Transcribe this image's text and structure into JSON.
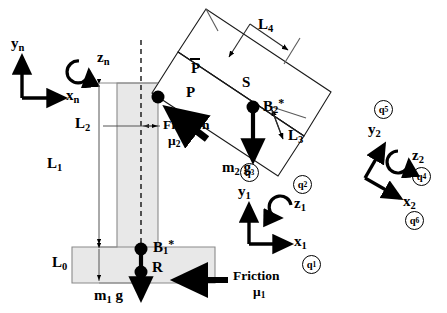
{
  "figure": {
    "type": "mechanism-free-body-diagram",
    "title": "",
    "background": "#ffffff",
    "line_color": "#000000",
    "body1_fill": "#e8e8e8",
    "body2_fill": "#ffffff"
  },
  "frames": {
    "n": {
      "x_label": "x",
      "x_sub": "n",
      "y_label": "y",
      "y_sub": "n",
      "z_label": "z",
      "z_sub": "n"
    },
    "one": {
      "x_label": "x",
      "x_sub": "1",
      "y_label": "y",
      "y_sub": "1",
      "z_label": "z",
      "z_sub": "1"
    },
    "two": {
      "x_label": "x",
      "x_sub": "2",
      "y_label": "y",
      "y_sub": "2",
      "z_label": "z",
      "z_sub": "2"
    }
  },
  "generalized_coords": {
    "q1": {
      "letter": "q",
      "index": "1"
    },
    "q2": {
      "letter": "q",
      "index": "2"
    },
    "q3": {
      "letter": "q",
      "index": "3"
    },
    "q4": {
      "letter": "q",
      "index": "4"
    },
    "q5": {
      "letter": "q",
      "index": "5"
    },
    "q6": {
      "letter": "q",
      "index": "6"
    }
  },
  "dimensions": [
    {
      "name": "L0",
      "letter": "L",
      "index": "0"
    },
    {
      "name": "L1",
      "letter": "L",
      "index": "1"
    },
    {
      "name": "L2",
      "letter": "L",
      "index": "2"
    },
    {
      "name": "L3",
      "letter": "L",
      "index": "3"
    },
    {
      "name": "L4",
      "letter": "L",
      "index": "4"
    }
  ],
  "points": [
    {
      "name": "P",
      "label": "P"
    },
    {
      "name": "P-bar",
      "label": "P",
      "overbar": true
    },
    {
      "name": "S",
      "label": "S"
    },
    {
      "name": "R",
      "label": "R"
    },
    {
      "name": "B1-star",
      "letter": "B",
      "index": "1",
      "star": "*"
    },
    {
      "name": "B2-star",
      "letter": "B",
      "index": "2",
      "star": "*"
    }
  ],
  "forces": [
    {
      "name": "gravity-body1",
      "letter": "m",
      "index": "1",
      "term": "g",
      "direction": "down"
    },
    {
      "name": "gravity-body2",
      "letter": "m",
      "index": "2",
      "term": "g",
      "direction": "down"
    },
    {
      "name": "friction-1",
      "label": "Friction",
      "coefficient": "μ",
      "index": "1",
      "direction": "left"
    },
    {
      "name": "friction-2",
      "label": "Friction",
      "coefficient": "μ",
      "index": "2",
      "direction": "upper-left"
    }
  ]
}
